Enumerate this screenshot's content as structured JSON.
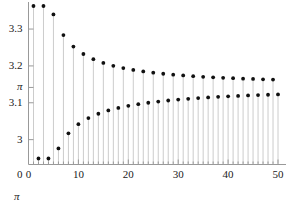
{
  "chart_data": {
    "type": "scatter",
    "title": "",
    "subtitle": "",
    "xlabel": "",
    "ylabel": "",
    "corner_label": "π",
    "grid": false,
    "legend": null,
    "marker": "filled-circle",
    "stems": true,
    "xlim": [
      0,
      51
    ],
    "ylim": [
      0,
      3.38
    ],
    "y_axis_break": true,
    "x_ticks": [
      0,
      10,
      20,
      30,
      40,
      50
    ],
    "x_tick_labels": [
      "0",
      "10",
      "20",
      "30",
      "40",
      "50"
    ],
    "x_minor_tick_step": 1,
    "y_ticks": [
      3,
      3.1,
      3.14159265,
      3.2,
      3.3
    ],
    "y_tick_labels": [
      "3",
      "3.1",
      "π",
      "3.2",
      "3.3"
    ],
    "y_origin_label": "0",
    "series_name": "Leibniz partial sums",
    "x": [
      1,
      2,
      3,
      4,
      5,
      6,
      7,
      8,
      9,
      10,
      11,
      12,
      13,
      14,
      15,
      16,
      17,
      18,
      19,
      20,
      21,
      22,
      23,
      24,
      25,
      26,
      27,
      28,
      29,
      30,
      31,
      32,
      33,
      34,
      35,
      36,
      37,
      38,
      39,
      40,
      41,
      42,
      43,
      44,
      45,
      46,
      47,
      48,
      49,
      50
    ],
    "values": [
      4.0,
      2.6667,
      3.4667,
      2.8952,
      3.3397,
      2.976,
      3.2837,
      3.0171,
      3.2524,
      3.0418,
      3.2323,
      3.0584,
      3.2184,
      3.0702,
      3.208,
      3.0791,
      3.2002,
      3.086,
      3.1941,
      3.0916,
      3.1891,
      3.0962,
      3.185,
      3.1,
      3.1816,
      3.1033,
      3.1787,
      3.1062,
      3.1762,
      3.1087,
      3.1741,
      3.1108,
      3.1722,
      3.1128,
      3.1705,
      3.1145,
      3.1691,
      3.116,
      3.1678,
      3.1174,
      3.1666,
      3.1187,
      3.1655,
      3.1198,
      3.1646,
      3.1208,
      3.1637,
      3.1218,
      3.1629,
      3.1227
    ],
    "note": "Partial sums of 4*sum((-1)^n/(2n+1)) converging to pi"
  },
  "colors": {
    "axis": "#999999",
    "tick_label": "#1a1a1a",
    "marker": "#111111",
    "stem": "#cccccc",
    "background": "#ffffff"
  }
}
